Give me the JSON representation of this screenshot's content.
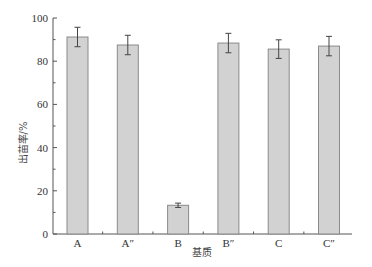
{
  "chart_data": {
    "type": "bar",
    "title": "",
    "xlabel": "基质",
    "ylabel": "出苗率/%",
    "categories": [
      "A",
      "A″",
      "B",
      "B″",
      "C",
      "C″"
    ],
    "values": [
      91.2,
      87.5,
      13.3,
      88.4,
      85.6,
      87.0
    ],
    "error": [
      4.5,
      4.5,
      1.0,
      4.5,
      4.3,
      4.5
    ],
    "ylim": [
      0,
      100
    ],
    "yticks": [
      0,
      20,
      40,
      60,
      80,
      100
    ],
    "grid": false,
    "legend": null,
    "colors": {
      "bar_fill": "#d2d2d2",
      "bar_edge": "#8a8a8a",
      "axis": "#555555",
      "error_bar": "#444444"
    }
  }
}
